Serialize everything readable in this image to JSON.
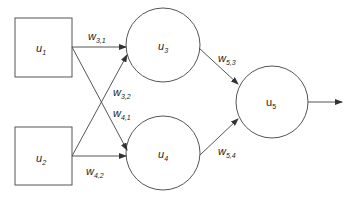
{
  "diagram": {
    "type": "neural-network",
    "colors": {
      "stroke": "#555555",
      "text": "#222222",
      "background": "#ffffff"
    },
    "nodes": [
      {
        "id": "u1",
        "label": "u",
        "sub": "1",
        "shape": "square"
      },
      {
        "id": "u2",
        "label": "u",
        "sub": "2",
        "shape": "square"
      },
      {
        "id": "u3",
        "label": "u",
        "sub": "3",
        "shape": "circle"
      },
      {
        "id": "u4",
        "label": "u",
        "sub": "4",
        "shape": "circle"
      },
      {
        "id": "u5",
        "label": "u",
        "sub": "5",
        "shape": "circle"
      }
    ],
    "edges": [
      {
        "from": "u1",
        "to": "u3",
        "label": "w",
        "sub": "3,1"
      },
      {
        "from": "u2",
        "to": "u3",
        "label": "w",
        "sub": "3,2"
      },
      {
        "from": "u1",
        "to": "u4",
        "label": "w",
        "sub": "4,1"
      },
      {
        "from": "u2",
        "to": "u4",
        "label": "w",
        "sub": "4,2"
      },
      {
        "from": "u3",
        "to": "u5",
        "label": "w",
        "sub": "5,3"
      },
      {
        "from": "u4",
        "to": "u5",
        "label": "w",
        "sub": "5,4"
      },
      {
        "from": "u5",
        "to": "output",
        "label": "",
        "sub": ""
      }
    ]
  }
}
